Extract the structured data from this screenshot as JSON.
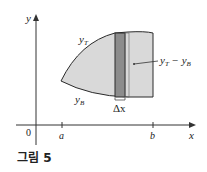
{
  "figure": {
    "caption": "그림 5",
    "axes": {
      "x_label": "x",
      "y_label": "y",
      "origin_label": "0",
      "tick_a_label": "a",
      "tick_b_label": "b"
    },
    "region": {
      "top_curve_label": "y",
      "top_curve_subscript": "T",
      "bottom_curve_label": "y",
      "bottom_curve_subscript": "B",
      "strip_width_label": "Δx",
      "strip_height_label_main": "y",
      "strip_height_label_sub1": "T",
      "strip_height_label_minus": " − y",
      "strip_height_label_sub2": "B"
    },
    "colors": {
      "region_fill": "#d9d9d9",
      "strip_fill": "#8c8c8c",
      "outline": "#2a2a2a",
      "axis": "#333333"
    }
  }
}
